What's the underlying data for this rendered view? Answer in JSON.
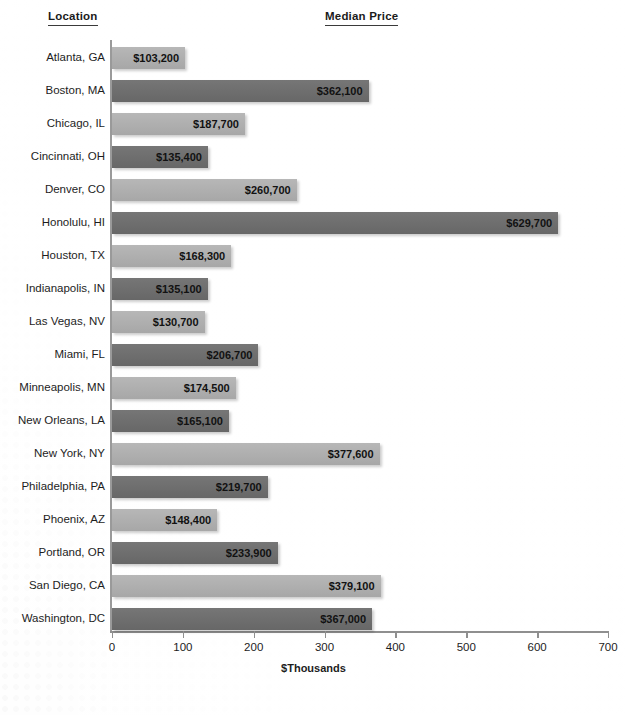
{
  "headers": {
    "location": "Location",
    "median_price": "Median Price"
  },
  "chart_data": {
    "type": "bar",
    "orientation": "horizontal",
    "title": "",
    "xlabel": "$Thousands",
    "ylabel": "Location",
    "value_axis_header": "Median Price",
    "xlim": [
      0,
      700
    ],
    "xticks": [
      0,
      100,
      200,
      300,
      400,
      500,
      600,
      700
    ],
    "grid": false,
    "legend": "none",
    "units": "thousands of dollars",
    "colors": {
      "bar_light": "#ADADAD",
      "bar_dark": "#6E6E6E",
      "axis": "#8F8F8F",
      "text": "#1D1D1D",
      "background": "#FDFDFD"
    },
    "categories": [
      "Atlanta, GA",
      "Boston, MA",
      "Chicago, IL",
      "Cincinnati, OH",
      "Denver, CO",
      "Honolulu, HI",
      "Houston, TX",
      "Indianapolis, IN",
      "Las Vegas, NV",
      "Miami, FL",
      "Minneapolis, MN",
      "New Orleans, LA",
      "New York, NY",
      "Philadelphia, PA",
      "Phoenix, AZ",
      "Portland, OR",
      "San Diego, CA",
      "Washington, DC"
    ],
    "values": [
      103.2,
      362.1,
      187.7,
      135.4,
      260.7,
      629.7,
      168.3,
      135.1,
      130.7,
      206.7,
      174.5,
      165.1,
      377.6,
      219.7,
      148.4,
      233.9,
      379.1,
      367.0
    ],
    "data_labels": [
      "$103,200",
      "$362,100",
      "$187,700",
      "$135,400",
      "$260,700",
      "$629,700",
      "$168,300",
      "$135,100",
      "$130,700",
      "$206,700",
      "$174,500",
      "$165,100",
      "$377,600",
      "$219,700",
      "$148,400",
      "$233,900",
      "$379,100",
      "$367,000"
    ],
    "bar_shades": [
      "light",
      "dark",
      "light",
      "dark",
      "light",
      "dark",
      "light",
      "dark",
      "light",
      "dark",
      "light",
      "dark",
      "light",
      "dark",
      "light",
      "dark",
      "light",
      "dark"
    ]
  }
}
